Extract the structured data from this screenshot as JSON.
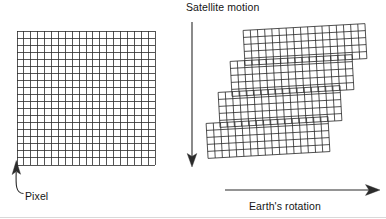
{
  "figure": {
    "background_color": "#ffffff",
    "line_color": "#2b2b2b",
    "text_color": "#151515",
    "width": 386,
    "height": 219
  },
  "labels": {
    "satellite_motion": "Satellite motion",
    "earths_rotation": "Earth's rotation",
    "pixel": "Pixel"
  },
  "icons": {
    "satellite_motion_arrow": "arrow-down-icon",
    "earths_rotation_arrow": "arrow-right-icon",
    "pixel_pointer": "curved-arrow-up-left-icon"
  },
  "left_grid": {
    "name": "ideal-pixel-grid",
    "x": 17,
    "y": 31,
    "width": 138,
    "height": 134,
    "columns": 20,
    "rows": 19,
    "cell_width": 6.9,
    "cell_height": 7.05,
    "skew": 0,
    "stroke": "#2b2b2b",
    "stroke_width": 0.8
  },
  "right_grid": {
    "name": "skewed-scan-swath",
    "description": "Four scan bands, each offset to the left and tilted relative to the band above",
    "band_count": 4,
    "columns": 17,
    "rows_per_band": 5,
    "cell_width": 7.2,
    "cell_height": 7.0,
    "band_tilt_deg": -3.2,
    "band_offset_x": -13,
    "bands": [
      {
        "index": 1,
        "x": 244,
        "y": 27,
        "width": 122,
        "height": 35
      },
      {
        "index": 2,
        "x": 231,
        "y": 58,
        "width": 122,
        "height": 35
      },
      {
        "index": 3,
        "x": 219,
        "y": 89,
        "width": 122,
        "height": 35
      },
      {
        "index": 4,
        "x": 207,
        "y": 120,
        "width": 122,
        "height": 35
      }
    ],
    "stroke": "#2b2b2b",
    "stroke_width": 0.8
  },
  "arrows": {
    "satellite_motion": {
      "orientation": "vertical-down",
      "x": 192,
      "y_start": 22,
      "y_end": 166
    },
    "earths_rotation": {
      "orientation": "horizontal-right",
      "y": 190,
      "x_start": 225,
      "x_end": 379
    },
    "pixel_pointer": {
      "orientation": "curved-up-left",
      "tip_x": 16,
      "tip_y": 160,
      "tail_x": 24,
      "tail_y": 194
    }
  }
}
